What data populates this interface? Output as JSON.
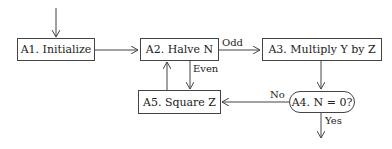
{
  "diagram": {
    "nodes": [
      {
        "id": "A1",
        "label": "A1. Initialize"
      },
      {
        "id": "A2",
        "label": "A2. Halve N"
      },
      {
        "id": "A3",
        "label": "A3. Multiply Y by Z"
      },
      {
        "id": "A4",
        "label": "A4. N = 0?"
      },
      {
        "id": "A5",
        "label": "A5. Square Z"
      }
    ],
    "edges": [
      {
        "from": "start",
        "to": "A1",
        "label": ""
      },
      {
        "from": "A1",
        "to": "A2",
        "label": ""
      },
      {
        "from": "A2",
        "to": "A3",
        "label": "Odd"
      },
      {
        "from": "A2",
        "to": "A5",
        "label": "Even"
      },
      {
        "from": "A3",
        "to": "A4",
        "label": ""
      },
      {
        "from": "A4",
        "to": "A5",
        "label": "No"
      },
      {
        "from": "A4",
        "to": "end",
        "label": "Yes"
      },
      {
        "from": "A5",
        "to": "A2",
        "label": ""
      }
    ]
  }
}
